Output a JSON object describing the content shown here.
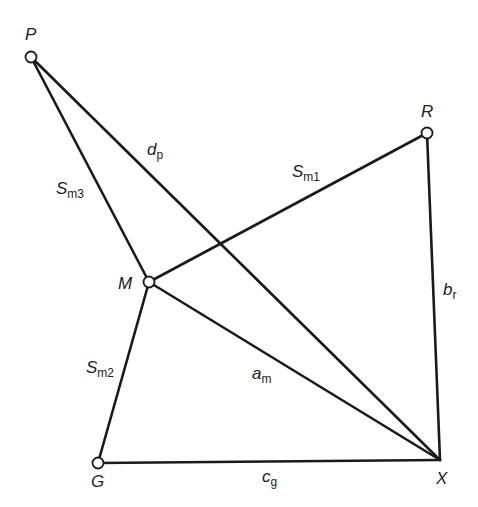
{
  "diagram": {
    "colors": {
      "line": "#1a1a1a",
      "node_fill": "#ffffff",
      "text": "#222222"
    },
    "nodes": {
      "P": {
        "label": "P",
        "x": 31,
        "y": 57
      },
      "R": {
        "label": "R",
        "x": 427,
        "y": 133
      },
      "M": {
        "label": "M",
        "x": 149,
        "y": 282
      },
      "G": {
        "label": "G",
        "x": 98,
        "y": 463
      },
      "X": {
        "label": "X",
        "x": 440,
        "y": 460
      }
    },
    "edges": {
      "dp": {
        "from": "P",
        "to": "X",
        "main": "d",
        "sub": "p"
      },
      "sm3": {
        "from": "P",
        "to": "M",
        "main": "S",
        "sub": "m3"
      },
      "sm1": {
        "from": "M",
        "to": "R",
        "main": "S",
        "sub": "m1"
      },
      "br": {
        "from": "R",
        "to": "X",
        "main": "b",
        "sub": "r"
      },
      "am": {
        "from": "M",
        "to": "X",
        "main": "a",
        "sub": "m"
      },
      "sm2": {
        "from": "M",
        "to": "G",
        "main": "S",
        "sub": "m2"
      },
      "cg": {
        "from": "G",
        "to": "X",
        "main": "c",
        "sub": "g"
      }
    }
  }
}
